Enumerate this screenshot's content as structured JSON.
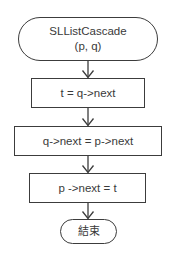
{
  "flowchart": {
    "start": {
      "line1": "SLListCascade",
      "line2": "(p, q)",
      "shape": "terminal"
    },
    "steps": [
      {
        "label": "t = q->next",
        "shape": "process"
      },
      {
        "label": "q->next = p->next",
        "shape": "process"
      },
      {
        "label": "p ->next = t",
        "shape": "process"
      }
    ],
    "end": {
      "label": "結束",
      "shape": "terminal"
    },
    "arrows": [
      {
        "from": "start",
        "to": "step-1"
      },
      {
        "from": "step-1",
        "to": "step-2"
      },
      {
        "from": "step-2",
        "to": "step-3"
      },
      {
        "from": "step-3",
        "to": "end"
      }
    ]
  },
  "colors": {
    "stroke": "#3c3c3c",
    "text": "#3a3a3a",
    "background": "#ffffff"
  }
}
